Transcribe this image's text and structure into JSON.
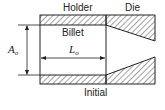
{
  "diagram": {
    "labels": {
      "holder": "Holder",
      "die": "Die",
      "billet": "Billet",
      "state": "Initial"
    },
    "dimensions": {
      "area_symbol": "A",
      "area_subscript": "o",
      "length_symbol": "L",
      "length_subscript": "o"
    },
    "colors": {
      "line": "#222222",
      "hatch": "#333333",
      "background": "#ffffff"
    }
  }
}
